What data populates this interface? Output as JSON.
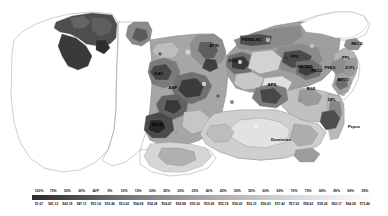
{
  "map": {
    "title": "PJM Zonal Map",
    "zones": [
      {
        "id": "ATSI",
        "label": "ATSI",
        "x": 214,
        "y": 46,
        "style": "dark"
      },
      {
        "id": "PENELEC",
        "label": "PENELEC",
        "x": 252,
        "y": 40,
        "style": "dark"
      },
      {
        "id": "DUQ",
        "label": "DUQ",
        "x": 233,
        "y": 61,
        "style": "dark"
      },
      {
        "id": "PPL",
        "label": "PPL",
        "x": 295,
        "y": 57,
        "style": "dark"
      },
      {
        "id": "METED",
        "label": "METED",
        "x": 305,
        "y": 67,
        "style": "dark"
      },
      {
        "id": "PECO",
        "label": "PECO",
        "x": 317,
        "y": 71,
        "style": "dark"
      },
      {
        "id": "PSEG",
        "label": "PSEG",
        "x": 329,
        "y": 68,
        "style": "dark"
      },
      {
        "id": "JCPL",
        "label": "JCPL",
        "x": 349,
        "y": 68,
        "style": "dark"
      },
      {
        "id": "AECO",
        "label": "AECO",
        "x": 343,
        "y": 79,
        "style": "dark"
      },
      {
        "id": "RECO",
        "label": "RECO",
        "x": 355,
        "y": 44,
        "style": "dark"
      },
      {
        "id": "PENLC2",
        "label": "PPL",
        "x": 345,
        "y": 58,
        "style": "dark"
      },
      {
        "id": "DAY",
        "label": "DAY",
        "x": 159,
        "y": 74,
        "style": "dark"
      },
      {
        "id": "AEP",
        "label": "AEP",
        "x": 172,
        "y": 88,
        "style": "dark"
      },
      {
        "id": "DEOK",
        "label": "DEOK",
        "x": 158,
        "y": 125,
        "style": "dark"
      },
      {
        "id": "APS",
        "label": "APS",
        "x": 272,
        "y": 85,
        "style": "dark"
      },
      {
        "id": "BGE",
        "label": "BGE",
        "x": 311,
        "y": 88,
        "style": "dark"
      },
      {
        "id": "DPL",
        "label": "DPL",
        "x": 330,
        "y": 98,
        "style": "dark"
      },
      {
        "id": "PEPCO",
        "label": "Pepco",
        "x": 352,
        "y": 126,
        "style": "dark"
      },
      {
        "id": "DOM",
        "label": "Dominion",
        "x": 281,
        "y": 140,
        "style": "dark"
      },
      {
        "id": "COMED",
        "label": "ComEd",
        "x": 84,
        "y": 30,
        "style": "dark"
      },
      {
        "id": "EKPC",
        "label": "EKPC",
        "x": 175,
        "y": 150,
        "style": "dark"
      }
    ]
  },
  "chart_data": {
    "type": "heatmap",
    "legend_position": "bottom",
    "legend_title": "",
    "percentile_ticks": [
      "100%",
      "75%",
      "50%",
      "25%",
      "AVP",
      "5%",
      "10%",
      "15%",
      "20%",
      "25%",
      "30%",
      "35%",
      "40%",
      "45%",
      "50%",
      "55%",
      "60%",
      "65%",
      "70%",
      "75%",
      "80%",
      "85%",
      "90%",
      "95%"
    ],
    "value_ticks": [
      "$1.67",
      "$41.15",
      "$43.19",
      "$47.11",
      "$53.14",
      "$53.46",
      "$53.62",
      "$54.08",
      "$54.38",
      "$54.47",
      "$54.98",
      "$55.30",
      "$55.09",
      "$55.78",
      "$56.05",
      "$56.31",
      "$56.65",
      "$57.42",
      "$57.63",
      "$58.42",
      "$59.34",
      "$60.17",
      "$64.28",
      "$73.46"
    ],
    "colorbar": {
      "from": "#3a3a3a",
      "to": "#ffffff",
      "reversed": true,
      "stops": [
        "#2a2a2a",
        "#555555",
        "#777777",
        "#9a9a9a",
        "#bcbcbc",
        "#d8d8d8",
        "#efefef",
        "#ffffff"
      ]
    },
    "xlabel": "",
    "ylabel": "",
    "grid": false
  }
}
